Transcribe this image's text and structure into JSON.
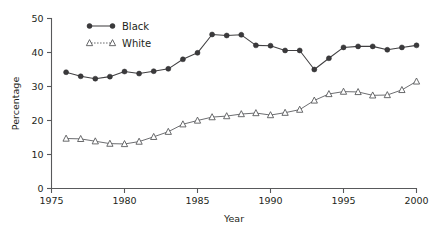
{
  "chart_data": {
    "type": "line",
    "title": "",
    "xlabel": "Year",
    "ylabel": "Percentage",
    "xlim": [
      1975,
      2000
    ],
    "ylim": [
      0,
      50
    ],
    "xticks": [
      1975,
      1980,
      1985,
      1990,
      1995,
      2000
    ],
    "yticks": [
      0,
      10,
      20,
      30,
      40,
      50
    ],
    "xtick_labels": [
      "1975",
      "1980",
      "1985",
      "1990",
      "1995",
      "2000"
    ],
    "ytick_labels": [
      "0",
      "10",
      "20",
      "30",
      "40",
      "50"
    ],
    "grid": false,
    "legend_position": "top-left-inside",
    "x": [
      1976,
      1977,
      1978,
      1979,
      1980,
      1981,
      1982,
      1983,
      1984,
      1985,
      1986,
      1987,
      1988,
      1989,
      1990,
      1991,
      1992,
      1993,
      1994,
      1995,
      1996,
      1997,
      1998,
      1999,
      2000
    ],
    "series": [
      {
        "name": "Black",
        "marker": "filled-circle",
        "color": "#414042",
        "values": [
          34.2,
          33.0,
          32.3,
          32.9,
          34.4,
          33.8,
          34.5,
          35.2,
          38.0,
          39.9,
          45.3,
          45.0,
          45.2,
          42.1,
          42.0,
          40.6,
          40.6,
          35.0,
          38.3,
          41.5,
          41.8,
          41.8,
          40.8,
          41.5,
          42.1
        ]
      },
      {
        "name": "White",
        "marker": "open-triangle",
        "color": "#6d6e71",
        "values": [
          14.7,
          14.6,
          13.9,
          13.2,
          13.1,
          13.8,
          15.2,
          16.7,
          18.9,
          20.0,
          21.0,
          21.3,
          21.9,
          22.2,
          21.6,
          22.3,
          23.2,
          25.9,
          27.8,
          28.5,
          28.4,
          27.4,
          27.5,
          29.0,
          31.5
        ]
      }
    ]
  },
  "legend": {
    "items": [
      {
        "label": "Black"
      },
      {
        "label": "White"
      }
    ]
  }
}
